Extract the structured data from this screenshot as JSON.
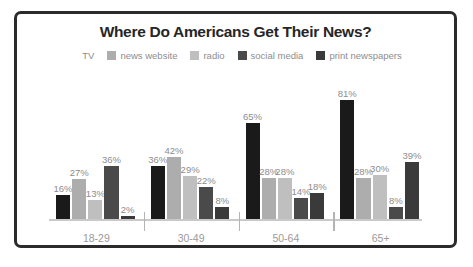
{
  "chart_data": {
    "type": "bar",
    "title": "Where Do Americans Get Their News?",
    "xlabel": "",
    "ylabel": "",
    "ylim": [
      0,
      100
    ],
    "grid": false,
    "legend_position": "top",
    "categories": [
      "18-29",
      "30-49",
      "50-64",
      "65+"
    ],
    "series": [
      {
        "name": "TV",
        "color": "#1a1a1a",
        "values": [
          16,
          36,
          65,
          81
        ],
        "labels": [
          "16%",
          "36%",
          "65%",
          "81%"
        ]
      },
      {
        "name": "news website",
        "color": "#adadad",
        "values": [
          27,
          42,
          28,
          28
        ],
        "labels": [
          "27%",
          "42%",
          "28%",
          "28%"
        ]
      },
      {
        "name": "radio",
        "color": "#bfbfbf",
        "values": [
          13,
          29,
          28,
          30
        ],
        "labels": [
          "13%",
          "29%",
          "28%",
          "30%"
        ]
      },
      {
        "name": "social media",
        "color": "#4a4a4a",
        "values": [
          36,
          22,
          14,
          8
        ],
        "labels": [
          "36%",
          "22%",
          "14%",
          "8%"
        ]
      },
      {
        "name": "print newspapers",
        "color": "#3a3a3a",
        "values": [
          2,
          8,
          18,
          39
        ],
        "labels": [
          "2%",
          "8%",
          "18%",
          "39%"
        ]
      }
    ]
  },
  "style": {
    "border_color": "#2b2b2b",
    "axis_color": "#c9c9c9",
    "tick_color": "#b4b4b4",
    "label_color": "#8d8d8d",
    "title_color": "#262626",
    "background": "#ffffff"
  }
}
